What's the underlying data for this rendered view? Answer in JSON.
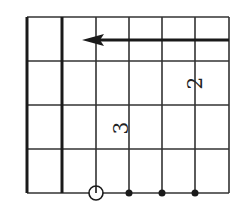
{
  "diagram": {
    "type": "chord-fretboard",
    "orientation": "rotated",
    "colors": {
      "line": "#333333",
      "thick_line": "#1a1a1a",
      "background": "#ffffff"
    },
    "grid": {
      "left": 27,
      "top": 17,
      "right": 229,
      "bottom": 193,
      "vertical_lines": [
        {
          "x": 27,
          "thick": true
        },
        {
          "x": 62,
          "thick": true
        },
        {
          "x": 96,
          "thick": false
        },
        {
          "x": 129,
          "thick": false
        },
        {
          "x": 162,
          "thick": false
        },
        {
          "x": 195,
          "thick": false
        },
        {
          "x": 229,
          "thick": false
        }
      ],
      "horizontal_lines": [
        17,
        61,
        105,
        149,
        193
      ]
    },
    "arrow": {
      "from_x": 229,
      "to_x": 82,
      "y": 40,
      "direction": "left"
    },
    "open_string_marker": {
      "x": 96,
      "y": 193,
      "r": 7,
      "symbol": "open-circle"
    },
    "dots": [
      {
        "x": 129,
        "y": 193
      },
      {
        "x": 162,
        "y": 193
      },
      {
        "x": 195,
        "y": 193
      }
    ],
    "finger_labels": [
      {
        "text": "3",
        "x": 122,
        "y": 128,
        "rotate": -90
      },
      {
        "text": "2",
        "x": 196,
        "y": 83,
        "rotate": -90
      }
    ]
  }
}
